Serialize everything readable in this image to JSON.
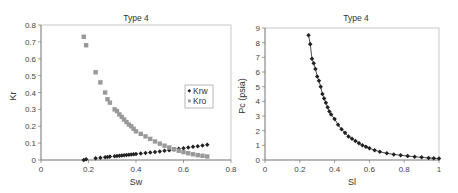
{
  "chart_data": [
    {
      "type": "scatter",
      "title": "Type 4",
      "xlabel": "Sw",
      "ylabel": "Kr",
      "xlim": [
        0,
        0.8
      ],
      "ylim": [
        0,
        0.8
      ],
      "xticks": [
        "0",
        "0.2",
        "0.4",
        "0.6",
        "0.8"
      ],
      "yticks": [
        "0",
        "0.1",
        "0.2",
        "0.3",
        "0.4",
        "0.5",
        "0.6",
        "0.7",
        "0.8"
      ],
      "grid": false,
      "legend_position": "right-middle",
      "series": [
        {
          "name": "Krw",
          "marker": "diamond",
          "color": "#222222",
          "x": [
            0.18,
            0.19,
            0.23,
            0.25,
            0.27,
            0.28,
            0.29,
            0.31,
            0.32,
            0.33,
            0.34,
            0.35,
            0.36,
            0.37,
            0.38,
            0.39,
            0.4,
            0.42,
            0.44,
            0.46,
            0.48,
            0.5,
            0.52,
            0.54,
            0.56,
            0.58,
            0.6,
            0.62,
            0.64,
            0.66,
            0.68,
            0.7
          ],
          "y": [
            0.0,
            0.005,
            0.01,
            0.013,
            0.016,
            0.018,
            0.02,
            0.022,
            0.024,
            0.025,
            0.027,
            0.028,
            0.03,
            0.031,
            0.033,
            0.034,
            0.036,
            0.039,
            0.042,
            0.045,
            0.048,
            0.051,
            0.055,
            0.058,
            0.062,
            0.066,
            0.07,
            0.074,
            0.078,
            0.082,
            0.086,
            0.09
          ]
        },
        {
          "name": "Kro",
          "marker": "square",
          "color": "#999999",
          "x": [
            0.18,
            0.19,
            0.23,
            0.25,
            0.27,
            0.28,
            0.29,
            0.31,
            0.32,
            0.33,
            0.34,
            0.35,
            0.36,
            0.37,
            0.38,
            0.39,
            0.4,
            0.42,
            0.44,
            0.46,
            0.48,
            0.5,
            0.52,
            0.54,
            0.56,
            0.58,
            0.6,
            0.62,
            0.64,
            0.66,
            0.68,
            0.7
          ],
          "y": [
            0.73,
            0.68,
            0.52,
            0.46,
            0.4,
            0.36,
            0.34,
            0.3,
            0.29,
            0.27,
            0.255,
            0.24,
            0.225,
            0.21,
            0.2,
            0.185,
            0.17,
            0.155,
            0.14,
            0.125,
            0.11,
            0.097,
            0.085,
            0.074,
            0.064,
            0.055,
            0.047,
            0.04,
            0.034,
            0.029,
            0.025,
            0.021
          ]
        }
      ]
    },
    {
      "type": "line",
      "title": "Type 4",
      "xlabel": "Sl",
      "ylabel": "Pc (psia)",
      "xlim": [
        0,
        1
      ],
      "ylim": [
        0,
        9
      ],
      "xticks": [
        "0",
        "0.2",
        "0.4",
        "0.6",
        "0.8",
        "1"
      ],
      "yticks": [
        "0",
        "1",
        "2",
        "3",
        "4",
        "5",
        "6",
        "7",
        "8",
        "9"
      ],
      "grid": false,
      "series": [
        {
          "name": "Pc",
          "marker": "diamond",
          "color": "#222222",
          "x": [
            0.25,
            0.26,
            0.27,
            0.28,
            0.29,
            0.3,
            0.31,
            0.32,
            0.33,
            0.34,
            0.35,
            0.36,
            0.37,
            0.38,
            0.4,
            0.42,
            0.44,
            0.46,
            0.48,
            0.5,
            0.52,
            0.54,
            0.56,
            0.58,
            0.6,
            0.63,
            0.66,
            0.7,
            0.74,
            0.78,
            0.82,
            0.86,
            0.9,
            0.94,
            0.97,
            1.0
          ],
          "y": [
            8.5,
            7.9,
            6.9,
            6.6,
            6.2,
            5.7,
            5.4,
            5.0,
            4.5,
            4.2,
            3.9,
            3.6,
            3.3,
            3.1,
            2.8,
            2.4,
            2.1,
            1.85,
            1.6,
            1.45,
            1.3,
            1.15,
            1.0,
            0.9,
            0.8,
            0.67,
            0.56,
            0.46,
            0.38,
            0.32,
            0.27,
            0.22,
            0.18,
            0.14,
            0.12,
            0.1
          ]
        }
      ]
    }
  ]
}
